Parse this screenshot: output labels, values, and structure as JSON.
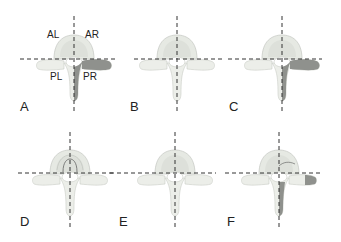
{
  "figure": {
    "panels": [
      {
        "id": "A",
        "label": "A",
        "cx": 74,
        "cy": 59,
        "shaded": [
          "PR"
        ],
        "quadrant_labels": {
          "AL": "AL",
          "AR": "AR",
          "PL": "PL",
          "PR": "PR"
        }
      },
      {
        "id": "B",
        "label": "B",
        "cx": 177,
        "cy": 59,
        "shaded": []
      },
      {
        "id": "C",
        "label": "C",
        "cx": 282,
        "cy": 59,
        "shaded": [
          "PR-transverse",
          "PR-lamina"
        ]
      },
      {
        "id": "D",
        "label": "D",
        "cx": 70,
        "cy": 174,
        "shaded": [],
        "feature": "central-oval-outline"
      },
      {
        "id": "E",
        "label": "E",
        "cx": 175,
        "cy": 174,
        "shaded": []
      },
      {
        "id": "F",
        "label": "F",
        "cx": 279,
        "cy": 174,
        "shaded": [
          "PR-transverse-tip",
          "PR-lamina"
        ],
        "feature": "AR-partial-outline"
      }
    ],
    "colors": {
      "bone": "#e9ebe7",
      "bone_edge": "#c9ccc6",
      "body_shade": "#dcdfd9",
      "shaded": "#8f918d",
      "dash": "#333333"
    }
  }
}
